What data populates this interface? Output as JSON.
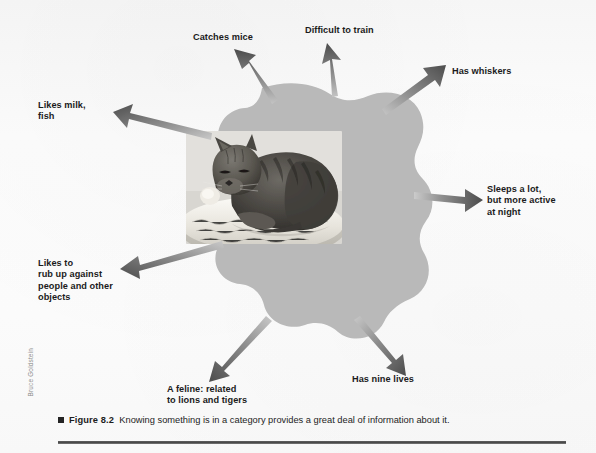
{
  "figure": {
    "id": "figure-8-2",
    "blob_color": "#b8b8b8",
    "arrow_color": "#585858",
    "background_color": "#fbfbfb",
    "text_color": "#1b1b1b"
  },
  "central_image": {
    "name": "cat-photograph",
    "description": "Grayscale photograph of a tabby cat curled up resting in a white fleece pet bed",
    "subject": "cat"
  },
  "labels": [
    {
      "id": "catches-mice",
      "text": "Catches mice"
    },
    {
      "id": "difficult-to-train",
      "text": "Difficult to train"
    },
    {
      "id": "has-whiskers",
      "text": "Has whiskers"
    },
    {
      "id": "likes-milk-fish",
      "text": "Likes milk,\nfish"
    },
    {
      "id": "sleeps-a-lot",
      "text": "Sleeps a lot,\nbut more active\nat night"
    },
    {
      "id": "likes-to-rub",
      "text": "Likes to\nrub up against\npeople and other\nobjects"
    },
    {
      "id": "a-feline",
      "text": "A feline: related\nto lions and tigers"
    },
    {
      "id": "has-nine-lives",
      "text": "Has nine lives"
    }
  ],
  "credit": {
    "text": "Bruce Goldstein"
  },
  "caption": {
    "figure_number": "Figure 8.2",
    "text": "Knowing something is in a category provides a great deal of information about it."
  }
}
